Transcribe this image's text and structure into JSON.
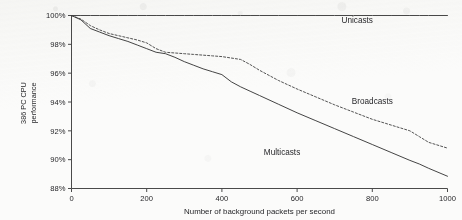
{
  "chart_data": {
    "type": "line",
    "title": "",
    "xlabel": "Number of background packets per second",
    "ylabel": "386 PC CPU performance",
    "ylabel_line1": "386 PC CPU",
    "ylabel_line2": "performance",
    "xlim": [
      0,
      1000
    ],
    "ylim": [
      88,
      100
    ],
    "grid": false,
    "legend_position": "inline-annotations",
    "xticks": [
      "0",
      "200",
      "400",
      "600",
      "800",
      "1000"
    ],
    "xtick_values": [
      0,
      200,
      400,
      600,
      800,
      1000
    ],
    "yticks": [
      "88%",
      "90%",
      "92%",
      "94%",
      "96%",
      "98%",
      "100%"
    ],
    "ytick_values": [
      88,
      90,
      92,
      94,
      96,
      98,
      100
    ],
    "x": [
      0,
      25,
      50,
      75,
      100,
      125,
      150,
      175,
      200,
      225,
      250,
      275,
      300,
      325,
      350,
      375,
      400,
      425,
      450,
      475,
      500,
      550,
      600,
      650,
      700,
      750,
      800,
      850,
      900,
      925,
      950,
      1000
    ],
    "series": [
      {
        "name": "Unicasts",
        "label": "Unicasts",
        "style": "solid",
        "color": "#3f3f3f",
        "values": [
          100,
          100,
          100,
          100,
          100,
          100,
          100,
          100,
          100,
          100,
          100,
          100,
          100,
          100,
          100,
          100,
          100,
          100,
          100,
          100,
          100,
          100,
          100,
          100,
          100,
          100,
          100,
          100,
          100,
          100,
          100,
          100
        ]
      },
      {
        "name": "Broadcasts",
        "label": "Broadcasts",
        "style": "dashed",
        "color": "#4a4a4a",
        "values": [
          100.0,
          99.75,
          99.3,
          99.0,
          98.75,
          98.6,
          98.45,
          98.3,
          98.1,
          97.7,
          97.45,
          97.4,
          97.35,
          97.3,
          97.25,
          97.2,
          97.15,
          97.05,
          96.95,
          96.6,
          96.2,
          95.5,
          94.9,
          94.35,
          93.8,
          93.3,
          92.8,
          92.4,
          92.0,
          91.6,
          91.2,
          90.8
        ]
      },
      {
        "name": "Multicasts",
        "label": "Multicasts",
        "style": "solid",
        "color": "#3a3a3a",
        "values": [
          100.0,
          99.7,
          99.1,
          98.85,
          98.6,
          98.4,
          98.2,
          97.95,
          97.7,
          97.45,
          97.35,
          97.1,
          96.8,
          96.55,
          96.3,
          96.1,
          95.9,
          95.4,
          95.05,
          94.75,
          94.45,
          93.85,
          93.25,
          92.7,
          92.15,
          91.6,
          91.05,
          90.5,
          89.95,
          89.7,
          89.4,
          88.85
        ]
      }
    ],
    "annotations": [
      {
        "text": "Unicasts",
        "x": 760,
        "y": 99.45
      },
      {
        "text": "Broadcasts",
        "x": 800,
        "y": 93.85
      },
      {
        "text": "Multicasts",
        "x": 560,
        "y": 90.35
      }
    ]
  }
}
